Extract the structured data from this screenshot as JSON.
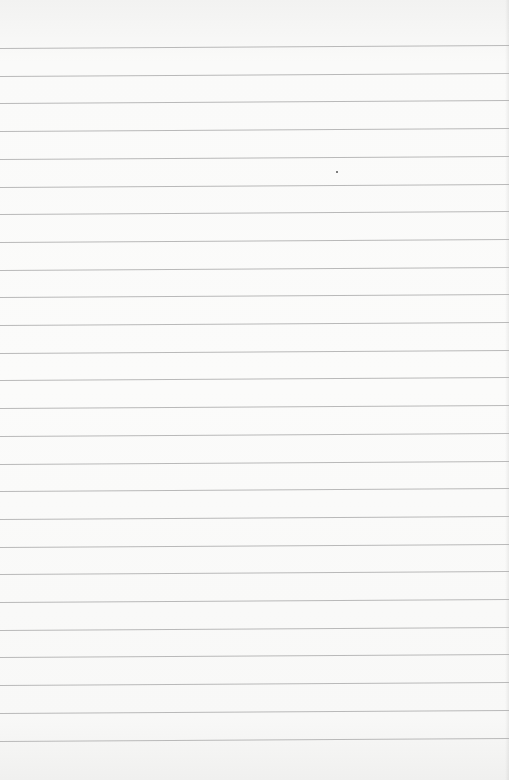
{
  "page": {
    "type": "blank ruled paper",
    "background_color": "#fafaf9",
    "rule_color": "#b9b9b9",
    "rule_count": 26,
    "first_rule_y": 48,
    "rule_spacing_px": 27.7,
    "text_content": ""
  }
}
